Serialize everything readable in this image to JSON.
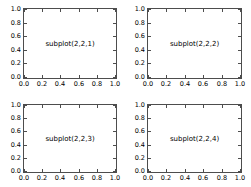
{
  "figure": {
    "width": 251,
    "height": 187,
    "background": "#ffffff",
    "axes_edge_color": "#4d4d4d",
    "text_color": "#000000"
  },
  "chart_data": {
    "type": "line",
    "title": "",
    "xlabel": "",
    "ylabel": "",
    "grid": false,
    "legend": null,
    "layout": "2x2 subplot grid",
    "subplots": [
      {
        "index": 1,
        "label": "subplot(2,2,1)",
        "position": "top-left",
        "xlim": [
          0.0,
          1.0
        ],
        "ylim": [
          0.0,
          1.0
        ],
        "xticks": [
          "0.0",
          "0.2",
          "0.4",
          "0.6",
          "0.8",
          "1.0"
        ],
        "yticks": [
          "0.0",
          "0.2",
          "0.4",
          "0.6",
          "0.8",
          "1.0"
        ],
        "series": []
      },
      {
        "index": 2,
        "label": "subplot(2,2,2)",
        "position": "top-right",
        "xlim": [
          0.0,
          1.0
        ],
        "ylim": [
          0.0,
          1.0
        ],
        "xticks": [
          "0.0",
          "0.2",
          "0.4",
          "0.6",
          "0.8",
          "1.0"
        ],
        "yticks": [
          "0.0",
          "0.2",
          "0.4",
          "0.6",
          "0.8",
          "1.0"
        ],
        "series": []
      },
      {
        "index": 3,
        "label": "subplot(2,2,3)",
        "position": "bottom-left",
        "xlim": [
          0.0,
          1.0
        ],
        "ylim": [
          0.0,
          1.0
        ],
        "xticks": [
          "0.0",
          "0.2",
          "0.4",
          "0.6",
          "0.8",
          "1.0"
        ],
        "yticks": [
          "0.0",
          "0.2",
          "0.4",
          "0.6",
          "0.8",
          "1.0"
        ],
        "series": []
      },
      {
        "index": 4,
        "label": "subplot(2,2,4)",
        "position": "bottom-right",
        "xlim": [
          0.0,
          1.0
        ],
        "ylim": [
          0.0,
          1.0
        ],
        "xticks": [
          "0.0",
          "0.2",
          "0.4",
          "0.6",
          "0.8",
          "1.0"
        ],
        "yticks": [
          "0.0",
          "0.2",
          "0.4",
          "0.6",
          "0.8",
          "1.0"
        ],
        "series": []
      }
    ]
  }
}
